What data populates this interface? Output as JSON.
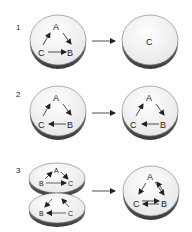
{
  "panels": [
    {
      "number": "1",
      "left_disc": {
        "nodes": {
          "A": "A",
          "B": "B",
          "C": "C"
        }
      },
      "right_disc": {
        "label": "C"
      }
    },
    {
      "number": "2",
      "left_disc": {
        "nodes": {
          "A": "A",
          "B": "B",
          "C": "C"
        }
      },
      "right_disc": {
        "nodes": {
          "A": "A",
          "B": "B",
          "C": "C"
        }
      }
    },
    {
      "number": "3",
      "top_disc": {
        "nodes": {
          "A": "A",
          "B": "B",
          "C": "C"
        }
      },
      "bottom_disc": {
        "nodes": {
          "B": "B",
          "C": "C"
        }
      },
      "right_disc": {
        "nodes": {
          "A": "A",
          "B": "B",
          "C": "C"
        }
      }
    }
  ],
  "colors": {
    "disc_face": "#f4f4f4",
    "disc_edge": "#555555",
    "ink": "#222222"
  }
}
